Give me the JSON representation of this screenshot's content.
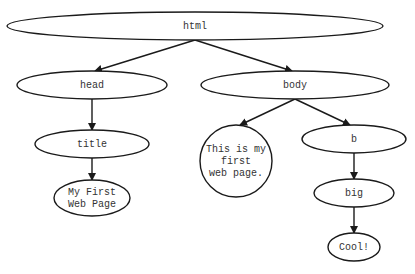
{
  "diagram": {
    "type": "dom-tree",
    "colors": {
      "stroke": "#1a1a1a",
      "text": "#333333",
      "background": "#ffffff"
    },
    "nodes": [
      {
        "id": "html",
        "shape": "ellipse",
        "cx": 195,
        "cy": 26,
        "rx": 188,
        "ry": 14,
        "lines": [
          "html"
        ]
      },
      {
        "id": "head",
        "shape": "ellipse",
        "cx": 92,
        "cy": 85,
        "rx": 75,
        "ry": 14,
        "lines": [
          "head"
        ]
      },
      {
        "id": "body",
        "shape": "ellipse",
        "cx": 295,
        "cy": 85,
        "rx": 94,
        "ry": 14,
        "lines": [
          "body"
        ]
      },
      {
        "id": "title",
        "shape": "ellipse",
        "cx": 92,
        "cy": 144,
        "rx": 57,
        "ry": 14,
        "lines": [
          "title"
        ]
      },
      {
        "id": "title_text",
        "shape": "ellipse",
        "cx": 92,
        "cy": 198,
        "rx": 38,
        "ry": 18,
        "lines": [
          "My First",
          "Web Page"
        ]
      },
      {
        "id": "body_text",
        "shape": "circle",
        "cx": 236,
        "cy": 161,
        "rx": 36,
        "ry": 36,
        "lines": [
          "This is my",
          "first",
          "web page."
        ]
      },
      {
        "id": "b",
        "shape": "ellipse",
        "cx": 354,
        "cy": 139,
        "rx": 52,
        "ry": 14,
        "lines": [
          "b"
        ]
      },
      {
        "id": "big",
        "shape": "ellipse",
        "cx": 354,
        "cy": 193,
        "rx": 40,
        "ry": 14,
        "lines": [
          "big"
        ]
      },
      {
        "id": "cool",
        "shape": "ellipse",
        "cx": 354,
        "cy": 247,
        "rx": 26,
        "ry": 14,
        "lines": [
          "Cool!"
        ]
      }
    ],
    "edges": [
      {
        "from": "html",
        "to": "head",
        "x1": 195,
        "y1": 40,
        "x2": 95,
        "y2": 71
      },
      {
        "from": "html",
        "to": "body",
        "x1": 195,
        "y1": 40,
        "x2": 292,
        "y2": 71
      },
      {
        "from": "head",
        "to": "title",
        "x1": 92,
        "y1": 99,
        "x2": 92,
        "y2": 130
      },
      {
        "from": "title",
        "to": "title_text",
        "x1": 92,
        "y1": 158,
        "x2": 92,
        "y2": 180
      },
      {
        "from": "body",
        "to": "body_text",
        "x1": 295,
        "y1": 99,
        "x2": 240,
        "y2": 125
      },
      {
        "from": "body",
        "to": "b",
        "x1": 295,
        "y1": 99,
        "x2": 350,
        "y2": 125
      },
      {
        "from": "b",
        "to": "big",
        "x1": 354,
        "y1": 153,
        "x2": 354,
        "y2": 179
      },
      {
        "from": "big",
        "to": "cool",
        "x1": 354,
        "y1": 207,
        "x2": 354,
        "y2": 233
      }
    ]
  }
}
